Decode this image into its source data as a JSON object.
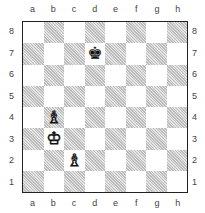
{
  "files": [
    "a",
    "b",
    "c",
    "d",
    "e",
    "f",
    "g",
    "h"
  ],
  "ranks": [
    "8",
    "7",
    "6",
    "5",
    "4",
    "3",
    "2",
    "1"
  ],
  "pieces": [
    {
      "square": "d7",
      "type": "king",
      "color": "black",
      "glyph": "♚"
    },
    {
      "square": "b4",
      "type": "bishop",
      "color": "white",
      "glyph": "♗"
    },
    {
      "square": "b3",
      "type": "king",
      "color": "white",
      "glyph": "♔"
    },
    {
      "square": "c2",
      "type": "bishop",
      "color": "white",
      "glyph": "♗"
    }
  ],
  "colors": {
    "border": "#222222",
    "dark_square": "#bdbdbd",
    "light_square": "#ffffff"
  }
}
